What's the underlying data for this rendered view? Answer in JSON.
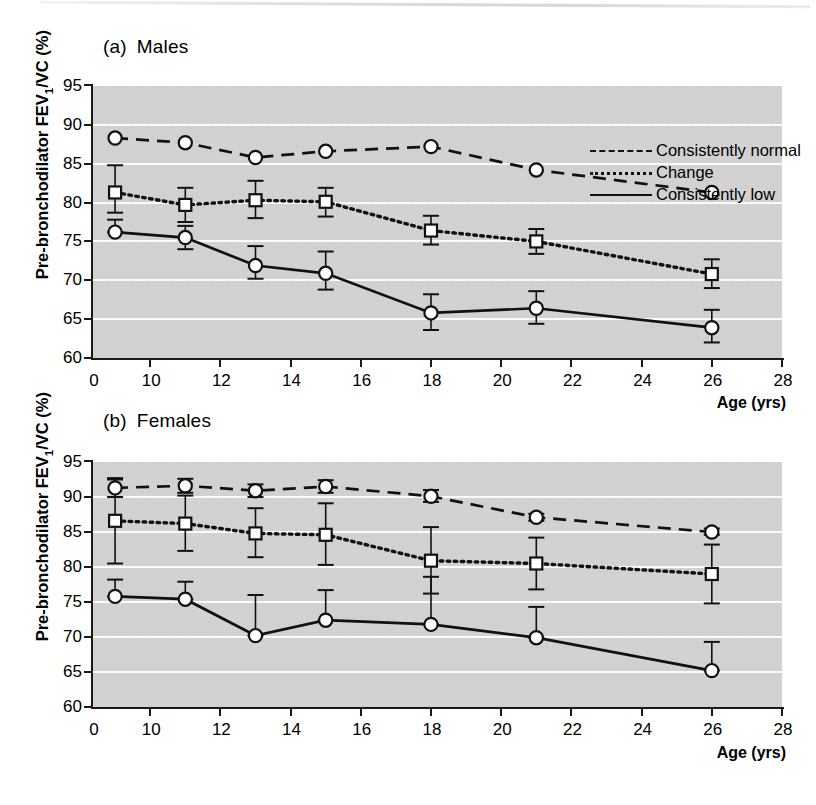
{
  "figure": {
    "ylabel_main": "Pre-bronchodilator FEV",
    "ylabel_sub": "1",
    "ylabel_tail": "/VC (%)",
    "xlabel": "Age (yrs)",
    "plot_bg": "#d2d2d2",
    "gridline_color": "#fbfbfb",
    "ink_color": "#111111"
  },
  "legend": {
    "position": "top-right-inside-panel-a",
    "entries": [
      {
        "label": "Consistently normal",
        "style": "dashed"
      },
      {
        "label": "Change",
        "style": "dotted"
      },
      {
        "label": "Consistently low",
        "style": "solid"
      }
    ]
  },
  "panels": [
    {
      "tag": "(a)",
      "title": "Males",
      "label_full": "(a)  Males"
    },
    {
      "tag": "(b)",
      "title": "Females",
      "label_full": "(b)  Females"
    }
  ],
  "chart_data": [
    {
      "type": "line",
      "panel": "(a)",
      "title": "(a)  Males",
      "xlabel": "Age (yrs)",
      "ylabel": "Pre-bronchodilator FEV1/VC (%)",
      "xlim": [
        0,
        28
      ],
      "ylim": [
        60,
        95
      ],
      "xticks": [
        0,
        10,
        12,
        14,
        16,
        18,
        20,
        22,
        24,
        26,
        28
      ],
      "yticks": [
        60,
        65,
        70,
        75,
        80,
        85,
        90,
        95
      ],
      "x_axis_break": "between 0 and 10",
      "grid": "horizontal",
      "x": [
        9,
        11,
        13,
        15,
        18,
        21,
        26
      ],
      "series": [
        {
          "name": "Consistently normal",
          "style": "dashed",
          "marker": "circle",
          "values": [
            88.3,
            87.7,
            85.8,
            86.6,
            87.2,
            84.2,
            81.3
          ],
          "err_low": [
            88.3,
            87.7,
            85.8,
            86.6,
            87.2,
            84.2,
            81.3
          ],
          "err_high": [
            88.3,
            87.7,
            85.8,
            86.6,
            87.2,
            84.2,
            81.3
          ]
        },
        {
          "name": "Change",
          "style": "dotted",
          "marker": "square",
          "values": [
            81.3,
            79.7,
            80.3,
            80.1,
            76.4,
            75.0,
            70.8
          ],
          "err_low": [
            78.7,
            77.5,
            78.0,
            78.2,
            74.6,
            73.4,
            69.0
          ],
          "err_high": [
            84.8,
            81.9,
            82.8,
            81.9,
            78.3,
            76.6,
            72.7
          ]
        },
        {
          "name": "Consistently low",
          "style": "solid",
          "marker": "circle",
          "values": [
            76.2,
            75.5,
            71.9,
            70.9,
            65.8,
            66.4,
            63.9
          ],
          "err_low": [
            76.2,
            74.0,
            70.2,
            68.8,
            63.6,
            64.4,
            62.0
          ],
          "err_high": [
            77.8,
            77.0,
            74.4,
            73.7,
            68.2,
            68.6,
            66.2
          ]
        }
      ]
    },
    {
      "type": "line",
      "panel": "(b)",
      "title": "(b)  Females",
      "xlabel": "Age (yrs)",
      "ylabel": "Pre-bronchodilator FEV1/VC (%)",
      "xlim": [
        0,
        28
      ],
      "ylim": [
        60,
        95
      ],
      "xticks": [
        0,
        10,
        12,
        14,
        16,
        18,
        20,
        22,
        24,
        26,
        28
      ],
      "yticks": [
        60,
        65,
        70,
        75,
        80,
        85,
        90,
        95
      ],
      "x_axis_break": "between 0 and 10",
      "grid": "horizontal",
      "x": [
        9,
        11,
        13,
        15,
        18,
        21,
        26
      ],
      "series": [
        {
          "name": "Consistently normal",
          "style": "dashed",
          "marker": "circle",
          "values": [
            91.3,
            91.6,
            90.9,
            91.5,
            90.1,
            87.1,
            85.0
          ],
          "err_low": [
            90.0,
            90.6,
            90.0,
            90.6,
            89.3,
            86.6,
            84.6
          ],
          "err_high": [
            92.7,
            92.6,
            91.8,
            92.4,
            91.0,
            87.6,
            85.5
          ]
        },
        {
          "name": "Change",
          "style": "dotted",
          "marker": "square",
          "values": [
            86.6,
            86.2,
            84.8,
            84.6,
            80.9,
            80.5,
            79.0
          ],
          "err_low": [
            80.5,
            82.3,
            81.4,
            80.3,
            76.2,
            76.8,
            74.8
          ],
          "err_high": [
            92.5,
            90.2,
            88.4,
            89.1,
            85.7,
            84.2,
            83.2
          ]
        },
        {
          "name": "Consistently low",
          "style": "solid",
          "marker": "circle",
          "values": [
            75.8,
            75.4,
            70.2,
            72.4,
            71.8,
            69.9,
            65.2
          ],
          "err_low": [
            75.8,
            75.4,
            70.2,
            72.4,
            71.8,
            69.9,
            65.2
          ],
          "err_high": [
            78.2,
            77.9,
            76.0,
            76.7,
            78.6,
            74.3,
            69.3
          ]
        }
      ]
    }
  ]
}
